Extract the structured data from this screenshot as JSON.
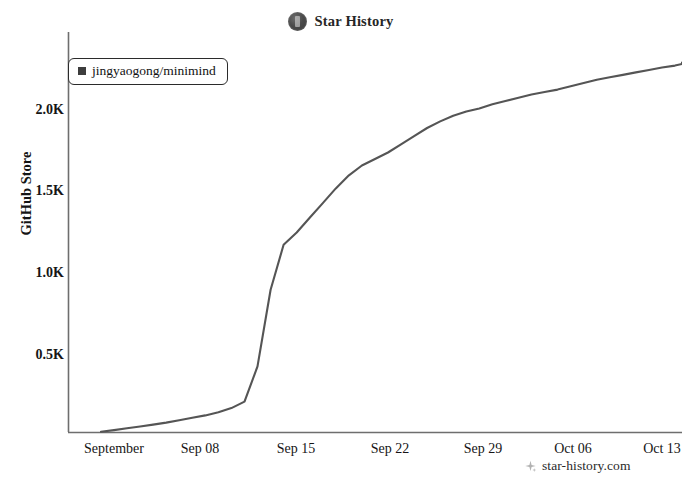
{
  "header": {
    "title": "Star History",
    "icon": "star-history-badge-icon"
  },
  "legend": {
    "entries": [
      {
        "label": "jingyaogong/minimind",
        "color": "#3d3d3d",
        "marker": "square"
      }
    ]
  },
  "watermark": {
    "text": "star-history.com",
    "icon": "sparkle-icon"
  },
  "axes": {
    "y_label": "GitHub Store",
    "y_ticks": [
      "0.5K",
      "1.0K",
      "1.5K",
      "2.0K"
    ],
    "x_ticks": [
      "September",
      "Sep 08",
      "Sep 15",
      "Sep 22",
      "Sep 29",
      "Oct 06",
      "Oct 13"
    ]
  },
  "chart_data": {
    "type": "line",
    "title": "Star History",
    "xlabel": "",
    "ylabel": "GitHub Store",
    "grid": false,
    "legend_position": "top-left",
    "line_color": "#555555",
    "xlim": [
      "2024-08-31",
      "2024-10-16"
    ],
    "ylim": [
      0,
      2400
    ],
    "x_tick_labels": [
      "September",
      "Sep 08",
      "Sep 15",
      "Sep 22",
      "Sep 29",
      "Oct 06",
      "Oct 13"
    ],
    "x_tick_dates": [
      "2024-09-01",
      "2024-09-08",
      "2024-09-15",
      "2024-09-22",
      "2024-09-29",
      "2024-10-06",
      "2024-10-13"
    ],
    "y_tick_values": [
      500,
      1000,
      1500,
      2000
    ],
    "y_tick_labels": [
      "0.5K",
      "1.0K",
      "1.5K",
      "2.0K"
    ],
    "series": [
      {
        "name": "jingyaogong/minimind",
        "color": "#555555",
        "x": [
          "2024-08-31",
          "2024-09-01",
          "2024-09-02",
          "2024-09-03",
          "2024-09-04",
          "2024-09-05",
          "2024-09-06",
          "2024-09-07",
          "2024-09-08",
          "2024-09-09",
          "2024-09-10",
          "2024-09-11",
          "2024-09-12",
          "2024-09-13",
          "2024-09-14",
          "2024-09-15",
          "2024-09-16",
          "2024-09-17",
          "2024-09-18",
          "2024-09-19",
          "2024-09-20",
          "2024-09-21",
          "2024-09-22",
          "2024-09-23",
          "2024-09-24",
          "2024-09-25",
          "2024-09-26",
          "2024-09-27",
          "2024-09-28",
          "2024-09-29",
          "2024-09-30",
          "2024-10-01",
          "2024-10-02",
          "2024-10-03",
          "2024-10-04",
          "2024-10-05",
          "2024-10-06",
          "2024-10-07",
          "2024-10-08",
          "2024-10-09",
          "2024-10-10",
          "2024-10-11",
          "2024-10-12",
          "2024-10-13",
          "2024-10-14",
          "2024-10-15",
          "2024-10-16"
        ],
        "values": [
          30,
          40,
          52,
          62,
          74,
          86,
          100,
          116,
          130,
          150,
          175,
          215,
          430,
          900,
          1175,
          1250,
          1340,
          1430,
          1520,
          1600,
          1660,
          1700,
          1740,
          1790,
          1840,
          1890,
          1930,
          1965,
          1990,
          2010,
          2035,
          2055,
          2075,
          2095,
          2110,
          2125,
          2145,
          2165,
          2185,
          2200,
          2215,
          2230,
          2245,
          2260,
          2272,
          2282,
          2290
        ]
      }
    ]
  }
}
